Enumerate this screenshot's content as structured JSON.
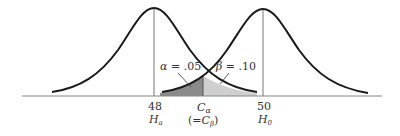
{
  "diagram": {
    "type": "hypothesis-test-distributions",
    "curves": [
      {
        "name": "Ha distribution",
        "mean_label": "48",
        "hypothesis_label": "H",
        "hypothesis_sub": "a"
      },
      {
        "name": "H0 distribution",
        "mean_label": "50",
        "hypothesis_label": "H",
        "hypothesis_sub": "0"
      }
    ],
    "critical_value": {
      "label": "C",
      "sub": "α",
      "equiv_prefix": "(=C",
      "equiv_sub": "β",
      "equiv_suffix": ")"
    },
    "regions": [
      {
        "name": "alpha",
        "label": "α = .05",
        "fill": "#8a8a8a"
      },
      {
        "name": "beta",
        "label": "β = .10",
        "fill": "#c8c8c8"
      }
    ],
    "colors": {
      "curve": "#1a1a1a",
      "axis": "#888888",
      "vline": "#777777"
    }
  }
}
